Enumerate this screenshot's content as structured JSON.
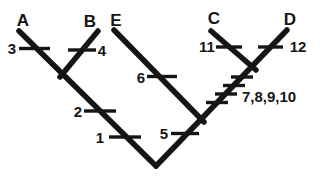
{
  "diagram": {
    "type": "cladogram",
    "topology": "((A,B),(E,(C,D)))",
    "line_color": "#151515",
    "background_color": "#ffffff",
    "taxa": {
      "a": "A",
      "b": "B",
      "e": "E",
      "c": "C",
      "d": "D"
    },
    "ticks": {
      "t1": "1",
      "t2": "2",
      "t3": "3",
      "t4": "4",
      "t5": "5",
      "t6": "6",
      "t7_10": "7,8,9,10",
      "t11": "11",
      "t12": "12"
    }
  }
}
